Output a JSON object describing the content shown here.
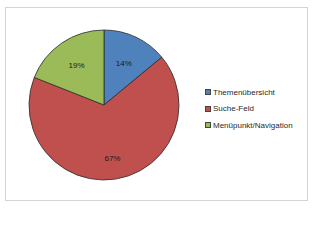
{
  "chart_data": {
    "type": "pie",
    "title": "",
    "categories": [
      "Themenübersicht",
      "Suche-Feld",
      "Menüpunkt/Navigation"
    ],
    "values": [
      14,
      67,
      19
    ],
    "labels": [
      "14%",
      "67%",
      "19%"
    ],
    "colors": [
      "#4f81bd",
      "#c0504d",
      "#9bbb59"
    ],
    "start_angle": "12 o'clock, clockwise",
    "legend_position": "right"
  },
  "legend": {
    "items": [
      {
        "label": "Themenübersicht",
        "color": "#4f81bd"
      },
      {
        "label": "Suche-Feld",
        "color": "#c0504d"
      },
      {
        "label": "Menüpunkt/Navigation",
        "color": "#9bbb59"
      }
    ]
  }
}
